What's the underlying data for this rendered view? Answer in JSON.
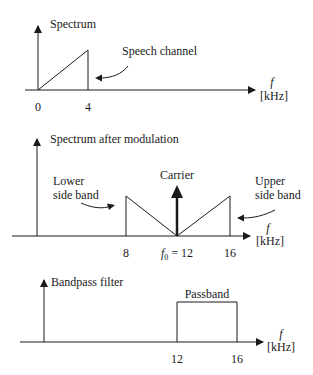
{
  "panels": [
    {
      "title": "Spectrum",
      "annotation": "Speech channel",
      "ticks": [
        "0",
        "4"
      ],
      "axis_symbol": "f",
      "axis_unit": "[kHz]"
    },
    {
      "title": "Spectrum after modulation",
      "lower_label_1": "Lower",
      "lower_label_2": "side band",
      "carrier_label": "Carrier",
      "upper_label_1": "Upper",
      "upper_label_2": "side band",
      "ticks": [
        "8",
        "= 12",
        "16"
      ],
      "f0_symbol": "f",
      "f0_sub": "0",
      "axis_symbol": "f",
      "axis_unit": "[kHz]"
    },
    {
      "title": "Bandpass filter",
      "box_label": "Passband",
      "ticks": [
        "12",
        "16"
      ],
      "axis_symbol": "f",
      "axis_unit": "[kHz]"
    }
  ],
  "colors": {
    "line": "#1a1a1a",
    "background": "#ffffff"
  }
}
